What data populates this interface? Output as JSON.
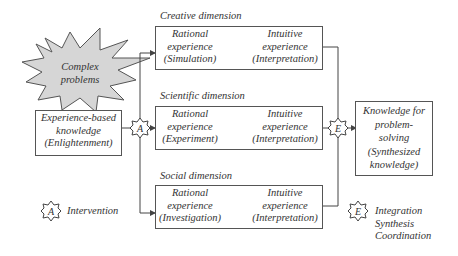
{
  "complex_problems": {
    "line1": "Complex",
    "line2": "problems"
  },
  "input_box": {
    "line1": "Experience-based",
    "line2": "knowledge",
    "line3": "(Enlightenment)"
  },
  "dimensions": [
    {
      "title": "Creative dimension",
      "badge": "B",
      "rational": {
        "line1": "Rational",
        "line2": "experience",
        "line3": "(Simulation)"
      },
      "intuitive": {
        "line1": "Intuitive",
        "line2": "experience",
        "line3": "(Interpretation)"
      }
    },
    {
      "title": "Scientific dimension",
      "badge": "C",
      "rational": {
        "line1": "Rational",
        "line2": "experience",
        "line3": "(Experiment)"
      },
      "intuitive": {
        "line1": "Intuitive",
        "line2": "experience",
        "line3": "(Interpretation)"
      }
    },
    {
      "title": "Social dimension",
      "badge": "D",
      "rational": {
        "line1": "Rational",
        "line2": "experience",
        "line3": "(Investigation)"
      },
      "intuitive": {
        "line1": "Intuitive",
        "line2": "experience",
        "line3": "(Interpretation)"
      }
    }
  ],
  "output_box": {
    "line1": "Knowledge for",
    "line2": "problem-",
    "line3": "solving",
    "line4": "(Synthesized",
    "line5": "knowledge)"
  },
  "nodes": {
    "a": "A",
    "e": "E"
  },
  "legend": {
    "a": {
      "badge": "A",
      "label": "Intervention"
    },
    "e": {
      "badge": "E",
      "line1": "Integration",
      "line2": "Synthesis",
      "line3": "Coordination"
    }
  }
}
